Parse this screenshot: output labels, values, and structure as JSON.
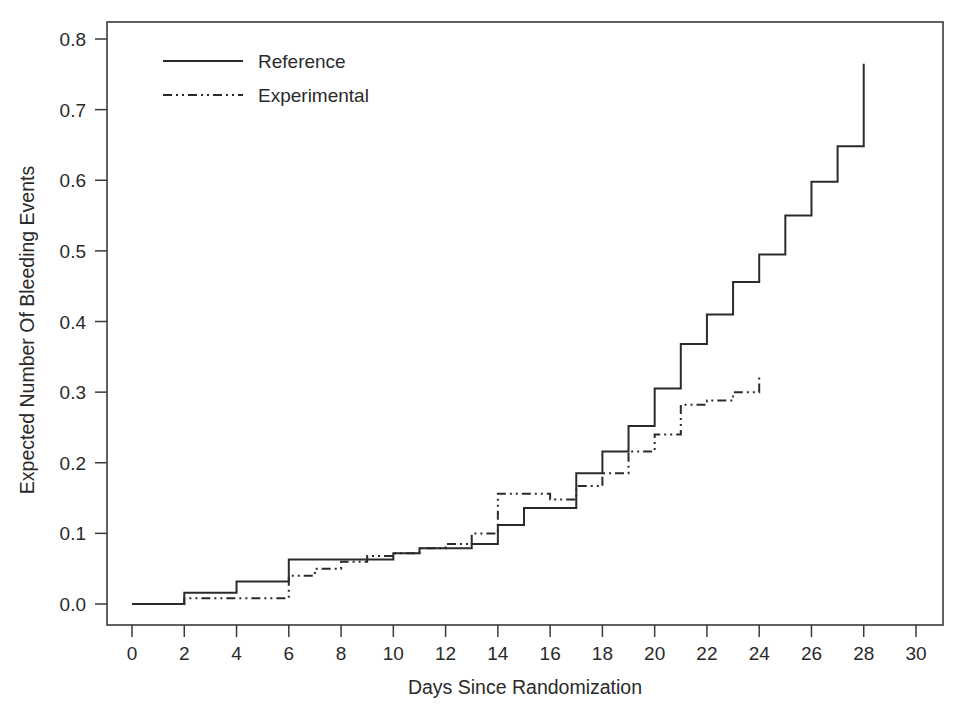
{
  "chart_data": {
    "type": "line",
    "subtype": "step-function cumulative mean curve",
    "title": "",
    "xlabel": "Days Since Randomization",
    "ylabel": "Expected Number Of Bleeding Events",
    "xlim": [
      -1.2,
      31.5
    ],
    "ylim": [
      -0.025,
      0.845
    ],
    "xticks": [
      0,
      2,
      4,
      6,
      8,
      10,
      12,
      14,
      16,
      18,
      20,
      22,
      24,
      26,
      28,
      30
    ],
    "xtick_labels": [
      "0",
      "2",
      "4",
      "6",
      "8",
      "10",
      "12",
      "14",
      "16",
      "18",
      "20",
      "22",
      "24",
      "26",
      "28",
      "30"
    ],
    "yticks": [
      0.0,
      0.1,
      0.2,
      0.3,
      0.4,
      0.5,
      0.6,
      0.7,
      0.8
    ],
    "ytick_labels": [
      "0.0",
      "0.1",
      "0.2",
      "0.3",
      "0.4",
      "0.5",
      "0.6",
      "0.7",
      "0.8"
    ],
    "grid": false,
    "legend_position": "top-left inside axes",
    "series": [
      {
        "name": "Reference",
        "linestyle": "solid",
        "color": "#2b2b2b",
        "x": [
          0,
          1,
          2,
          3,
          4,
          5,
          6,
          7,
          8,
          9,
          10,
          11,
          12,
          13,
          14,
          15,
          16,
          17,
          18,
          19,
          20,
          21,
          22,
          23,
          24,
          25,
          26,
          27,
          28,
          28
        ],
        "y": [
          0.0,
          0.0,
          0.016,
          0.016,
          0.032,
          0.032,
          0.063,
          0.063,
          0.063,
          0.063,
          0.072,
          0.079,
          0.079,
          0.085,
          0.112,
          0.136,
          0.136,
          0.185,
          0.216,
          0.252,
          0.305,
          0.368,
          0.41,
          0.456,
          0.495,
          0.55,
          0.598,
          0.648,
          0.712,
          0.765
        ]
      },
      {
        "name": "Experimental",
        "linestyle": "dash-dot",
        "color": "#2b2b2b",
        "x": [
          0,
          1,
          2,
          3,
          4,
          5,
          6,
          7,
          8,
          9,
          10,
          11,
          12,
          13,
          14,
          15,
          16,
          17,
          18,
          19,
          20,
          21,
          22,
          23,
          24,
          24
        ],
        "y": [
          0.0,
          0.0,
          0.008,
          0.008,
          0.008,
          0.008,
          0.04,
          0.05,
          0.06,
          0.068,
          0.072,
          0.079,
          0.085,
          0.1,
          0.156,
          0.156,
          0.148,
          0.167,
          0.185,
          0.216,
          0.24,
          0.282,
          0.288,
          0.3,
          0.313,
          0.325
        ]
      }
    ]
  },
  "legend": {
    "entries": [
      {
        "label": "Reference",
        "style": "solid"
      },
      {
        "label": "Experimental",
        "style": "dash-dot"
      }
    ]
  },
  "axes": {
    "x_title": "Days Since Randomization",
    "y_title": "Expected Number Of Bleeding Events"
  }
}
